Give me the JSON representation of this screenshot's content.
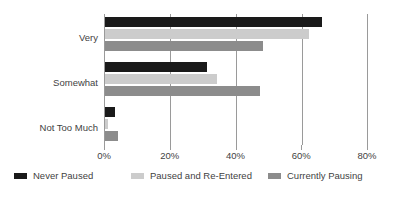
{
  "chart_data": {
    "type": "bar",
    "orientation": "horizontal",
    "title": "",
    "subtitle": "",
    "xlabel": "",
    "ylabel": "",
    "categories": [
      "Very",
      "Somewhat",
      "Not Too Much"
    ],
    "series": [
      {
        "name": "Never Paused",
        "color": "#1a1a1a",
        "values": [
          66,
          31,
          3
        ]
      },
      {
        "name": "Paused and Re-Entered",
        "color": "#cccccc",
        "values": [
          62,
          34,
          1
        ]
      },
      {
        "name": "Currently Pausing",
        "color": "#8c8c8c",
        "values": [
          48,
          47,
          4
        ]
      }
    ],
    "xlim": [
      0,
      80
    ],
    "xticks": [
      0,
      20,
      40,
      60,
      80
    ],
    "xtick_labels": [
      "0%",
      "20%",
      "40%",
      "60%",
      "80%"
    ],
    "grid": true,
    "legend_position": "bottom",
    "value_suffix": "%"
  },
  "colors": {
    "axis": "#9a9a9a",
    "text": "#3f3f3f",
    "background": "#ffffff"
  }
}
